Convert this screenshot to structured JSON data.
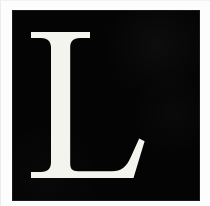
{
  "image": {
    "width": 210,
    "height": 206,
    "description": "Black square tile with a large white serif capital letter",
    "background_color": "#fdfdfd"
  },
  "tile": {
    "name": "letter-tile",
    "fill_color": "#040404",
    "x": 13,
    "y": 11,
    "width": 186,
    "height": 189
  },
  "glyph": {
    "character": "L",
    "color": "#f4f4ef",
    "style": "serif",
    "weight": "regular",
    "alt_text": "L"
  }
}
